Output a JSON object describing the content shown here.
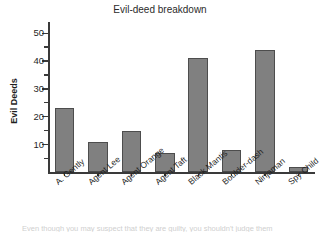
{
  "chart_data": {
    "type": "bar",
    "title": "Evil-deed breakdown",
    "xlabel": "",
    "ylabel": "Evil Deeds",
    "categories": [
      "A. Gently",
      "Agent Lee",
      "Agent Orange",
      "Agent Taft",
      "Black Mantis",
      "Boulder-dash",
      "Ninjaman",
      "Spy Child"
    ],
    "values": [
      23,
      11,
      15,
      7,
      41,
      8,
      44,
      2
    ],
    "ylim": [
      0,
      54
    ],
    "ytick_labels": [
      "10",
      "20",
      "30",
      "40",
      "50"
    ],
    "ytick_values": [
      10,
      20,
      30,
      40,
      50
    ],
    "yminor_values": [
      5,
      15,
      25,
      35,
      45
    ],
    "grid": false,
    "legend": null,
    "bar_color": "#808080",
    "bar_edge_color": "#4d4d4d",
    "axis_color": "#3a3a3a"
  },
  "footer": {
    "cropped_text": "Even though you may suspect that they are guilty, you shouldn't judge them"
  }
}
